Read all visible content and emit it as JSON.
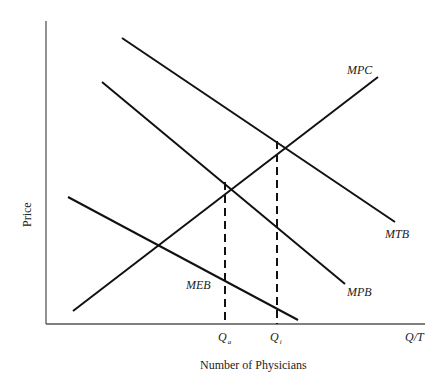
{
  "diagram": {
    "y_axis_label": "Price",
    "x_axis_label": "Number of Physicians",
    "x_axis_end_label": "Q/T",
    "curves": {
      "mpc": "MPC",
      "mtb": "MTB",
      "mpb": "MPB",
      "meb": "MEB"
    },
    "quantities": {
      "qa": {
        "main": "Q",
        "sub": "a"
      },
      "qi": {
        "main": "Q",
        "sub": "i"
      }
    },
    "colors": {
      "line": "#111111",
      "axis": "#555555",
      "text": "#222222"
    }
  }
}
